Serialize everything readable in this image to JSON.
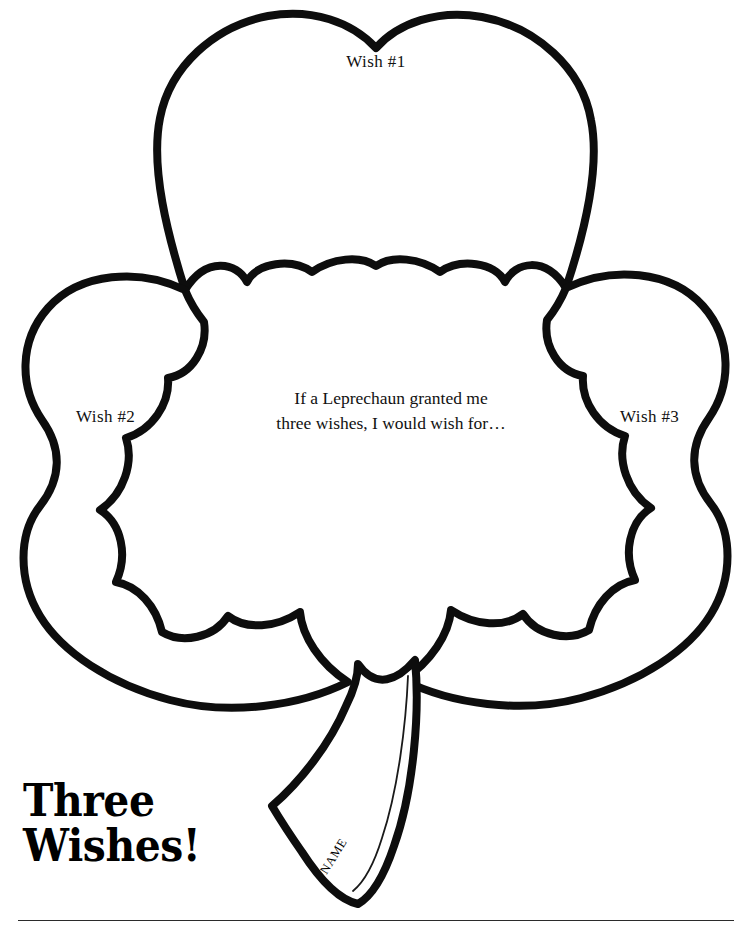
{
  "page": {
    "width": 752,
    "height": 942,
    "background_color": "#ffffff",
    "ink_color": "#000000",
    "type": "printable-worksheet"
  },
  "worksheet": {
    "title_line1": "Three",
    "title_line2": "Wishes!",
    "prompt_line1": "If a Leprechaun granted me",
    "prompt_line2": "three wishes, I would wish for…",
    "name_label": "NAME",
    "wish_labels": {
      "wish1": "Wish #1",
      "wish2": "Wish #2",
      "wish3": "Wish #3"
    },
    "footer_note": ""
  },
  "shamrock": {
    "stroke_color": "#0d0d0d",
    "stroke_width": 8,
    "fill": "#ffffff",
    "name_line_color": "#1a1a1a",
    "name_line_width": 1.6
  }
}
